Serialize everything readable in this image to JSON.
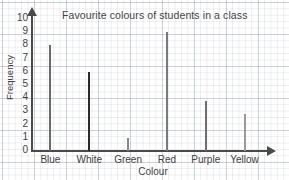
{
  "chart_data": {
    "type": "bar",
    "title": "Favourite colours of students in a class",
    "xlabel": "Colour",
    "ylabel": "Frequency",
    "categories": [
      "Blue",
      "White",
      "Green",
      "Red",
      "Purple",
      "Yellow"
    ],
    "values": [
      8,
      6,
      1,
      9,
      3.8,
      2.8
    ],
    "ylim": [
      0,
      10
    ],
    "ytick_labels": [
      "0",
      "1",
      "2",
      "3",
      "4",
      "5",
      "6",
      "7",
      "8",
      "9",
      "10"
    ],
    "grid": true,
    "legend": "none",
    "bar_colors": [
      "#6b6b6b",
      "#2b2b2b",
      "#8a8a8a",
      "#7a7a7a",
      "#6f6f6f",
      "#9a9a9a"
    ],
    "style": {
      "background": "#ffffff",
      "grid_color": "#8c96a5",
      "axis_color": "#4a4a4a",
      "text_color": "#3f3f3f"
    }
  }
}
